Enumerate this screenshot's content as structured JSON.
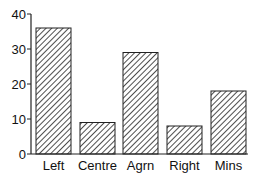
{
  "chart_data": {
    "type": "bar",
    "title": "",
    "xlabel": "",
    "ylabel": "",
    "categories": [
      "Left",
      "Centre",
      "Agrn",
      "Right",
      "Mins"
    ],
    "values": [
      36,
      9,
      29,
      8,
      18
    ],
    "ylim": [
      0,
      40
    ],
    "yticks": [
      0,
      10,
      20,
      30,
      40
    ],
    "grid": false,
    "legend": null,
    "bar_fill": "diagonal hatch",
    "colors": {
      "bar_stroke": "#222222",
      "hatch": "#222222",
      "axis": "#222222",
      "background": "#ffffff"
    }
  }
}
